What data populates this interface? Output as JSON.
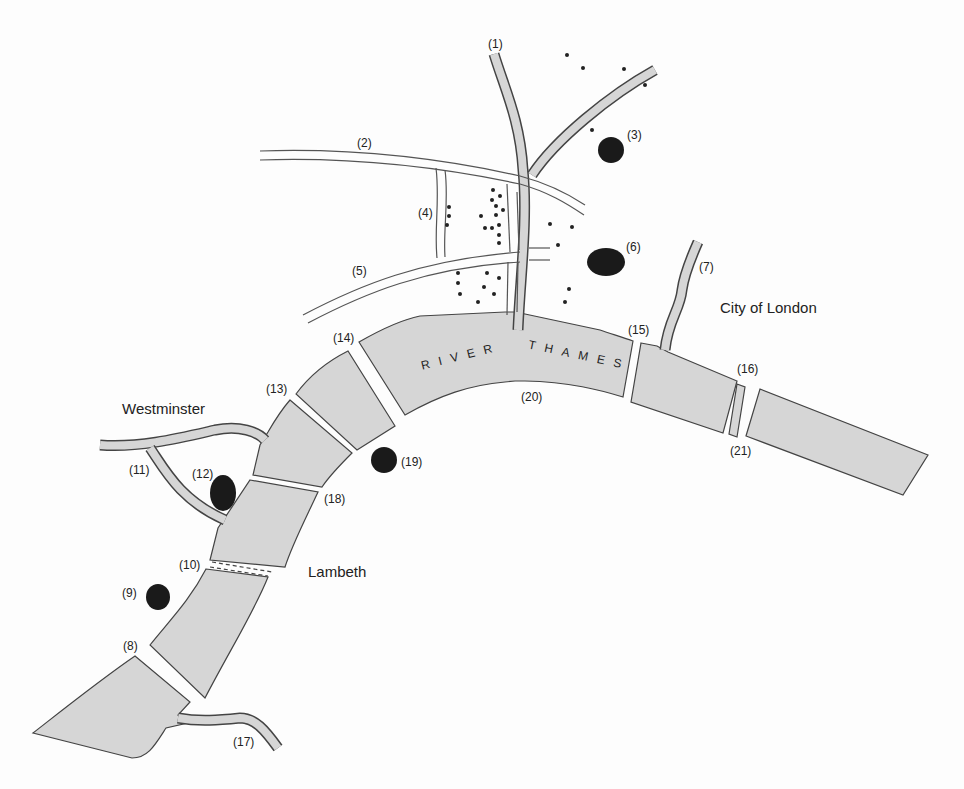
{
  "map": {
    "river_label_1": "RIVER",
    "river_label_2": "THAMES",
    "areas": {
      "westminster": "Westminster",
      "city_of_london": "City of London",
      "lambeth": "Lambeth"
    },
    "markers": {
      "m1": "(1)",
      "m2": "(2)",
      "m3": "(3)",
      "m4": "(4)",
      "m5": "(5)",
      "m6": "(6)",
      "m7": "(7)",
      "m8": "(8)",
      "m9": "(9)",
      "m10": "(10)",
      "m11": "(11)",
      "m12": "(12)",
      "m13": "(13)",
      "m14": "(14)",
      "m15": "(15)",
      "m16": "(16)",
      "m17": "(17)",
      "m18": "(18)",
      "m19": "(19)",
      "m20": "(20)",
      "m21": "(21)"
    },
    "colors": {
      "water": "#d6d6d6",
      "outline": "#444444",
      "landmark": "#1a1a1a"
    }
  }
}
